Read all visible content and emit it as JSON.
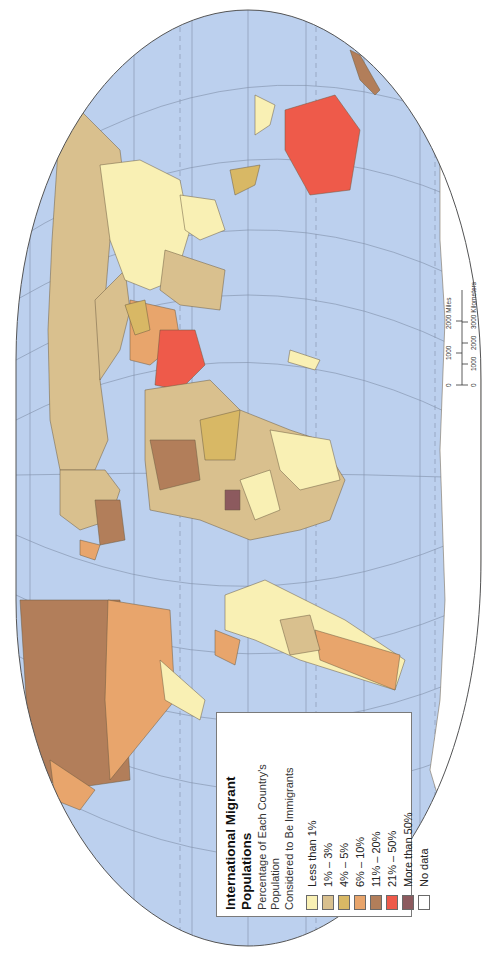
{
  "map": {
    "title": "International Migrant Populations",
    "orientation": "rotated 90° clockwise (north to the right)",
    "colors": {
      "ocean": "#bcd0ee",
      "graticule": "#7f8fa8",
      "coast": "#2f6fb5",
      "border": "#6b5a40",
      "frame": "#555555"
    }
  },
  "legend": {
    "title_line1": "International Migrant",
    "title_line2": "Populations",
    "subtitle_line1": "Percentage of Each Country's Population",
    "subtitle_line2": "Considered to Be Immigrants",
    "items": [
      {
        "label": "Less than 1%",
        "color": "#f9f0b4"
      },
      {
        "label": "1% – 3%",
        "color": "#d9c08e"
      },
      {
        "label": "4% – 5%",
        "color": "#d8b865"
      },
      {
        "label": "6% – 10%",
        "color": "#e8a56c"
      },
      {
        "label": "11% – 20%",
        "color": "#b27e5a"
      },
      {
        "label": "21% – 50%",
        "color": "#ee5a4a"
      },
      {
        "label": "More than 50%",
        "color": "#8c5a5e"
      },
      {
        "label": "No data",
        "color": "#ffffff"
      }
    ]
  },
  "scale_bar": {
    "miles_ticks": [
      "0",
      "1000",
      "2000 Miles"
    ],
    "km_ticks": [
      "0",
      "1000",
      "2000",
      "3000 Kilometers"
    ]
  }
}
